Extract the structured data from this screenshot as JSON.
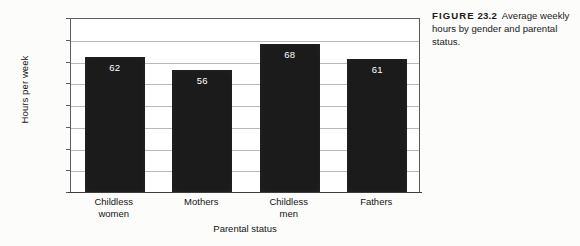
{
  "caption": {
    "figure_label": "FIGURE",
    "number": "23.2",
    "text": "Average weekly hours by gender and parental status."
  },
  "chart_data": {
    "type": "bar",
    "title": "",
    "xlabel": "Parental status",
    "ylabel": "Hours per week",
    "categories": [
      "Childless women",
      "Mothers",
      "Childless men",
      "Fathers"
    ],
    "category_lines": [
      [
        "Childless",
        "women"
      ],
      [
        "Mothers",
        ""
      ],
      [
        "Childless",
        "men"
      ],
      [
        "Fathers",
        ""
      ]
    ],
    "values": [
      62,
      56,
      68,
      61
    ],
    "value_labels": [
      "62",
      "56",
      "68",
      "61"
    ],
    "ylim": [
      0,
      80
    ],
    "ytick_labels": [
      "80",
      "70",
      "60",
      "50",
      "40",
      "30",
      "20",
      "10",
      "0"
    ],
    "ytick_values": [
      80,
      70,
      60,
      50,
      40,
      30,
      20,
      10,
      0
    ],
    "grid": true,
    "legend": "none",
    "bar_color": "#1b1b1b",
    "value_label_color": "#ffffff",
    "grid_color": "#b9b9b9",
    "axis_color": "#5c5c5c",
    "plot_background": "#ffffff",
    "page_background": "#fcfcfa"
  }
}
